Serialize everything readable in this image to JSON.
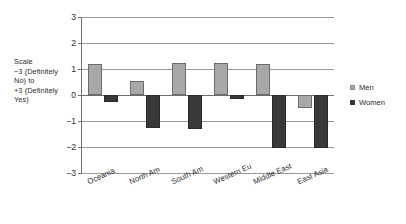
{
  "scale_caption": "Scale\n−3  (Definitely\nNo) to\n+3 (Definitely\nYes)",
  "colors": {
    "men": "#a8a8a8",
    "women": "#383838",
    "axis": "#6e6e6e",
    "grid": "#9a9a9a"
  },
  "legend": {
    "items": [
      {
        "label": "Men",
        "color": "#a8a8a8"
      },
      {
        "label": "Women",
        "color": "#383838"
      }
    ]
  },
  "axis": {
    "y_ticks": [
      "3",
      "2",
      "1",
      "0",
      "−1",
      "−2",
      "−3"
    ]
  },
  "chart_data": {
    "type": "bar",
    "title": "",
    "xlabel": "",
    "ylabel": "Scale −3 (Definitely No) to +3 (Definitely Yes)",
    "ylim": [
      -3,
      3
    ],
    "yticks": [
      3,
      2,
      1,
      0,
      -1,
      -2,
      -3
    ],
    "grid": true,
    "legend_position": "right",
    "orientation": "vertical",
    "grouping": "grouped",
    "categories": [
      "Oceania",
      "North Am",
      "South Am",
      "Western Eu",
      "Middle East",
      "East Asia"
    ],
    "series": [
      {
        "name": "Men",
        "color": "#a8a8a8",
        "values": [
          1.2,
          0.55,
          1.25,
          1.25,
          1.2,
          -0.5
        ]
      },
      {
        "name": "Women",
        "color": "#383838",
        "values": [
          -0.25,
          -1.25,
          -1.3,
          -0.15,
          -2.05,
          -2.05
        ]
      }
    ]
  }
}
